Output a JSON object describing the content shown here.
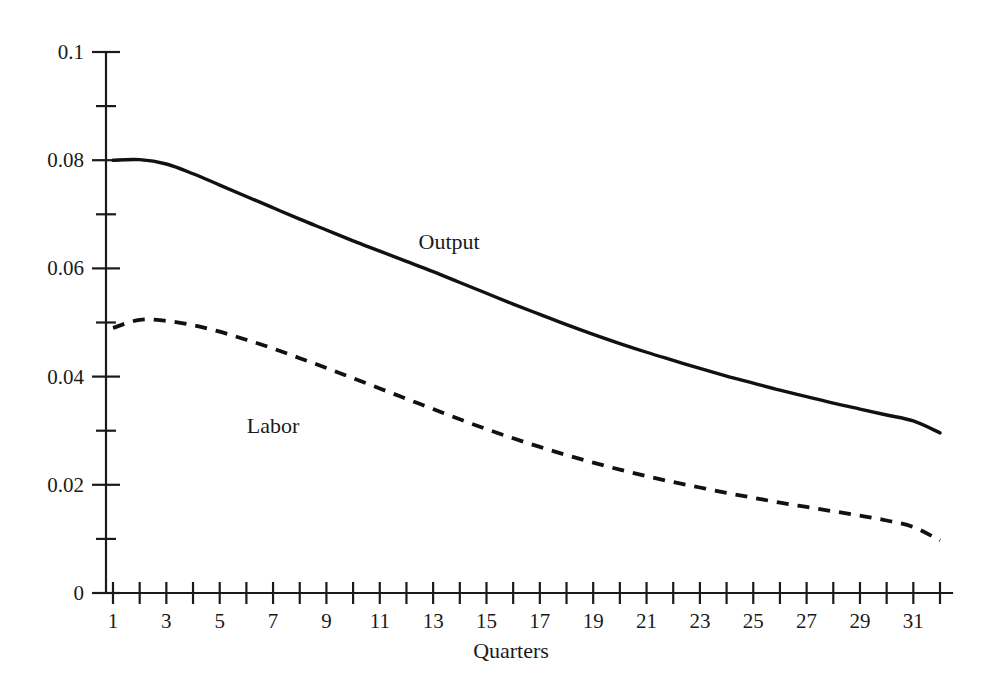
{
  "chart_data": {
    "type": "line",
    "title": "",
    "subtitle": "",
    "xlabel": "Quarters",
    "ylabel": "",
    "xlim": [
      1,
      32
    ],
    "ylim": [
      0,
      0.1
    ],
    "grid": false,
    "legend_position": "inline-annotation",
    "background_color": "#ffffff",
    "line_color": "#111111",
    "x": [
      1,
      2,
      3,
      4,
      5,
      6,
      7,
      8,
      9,
      10,
      11,
      12,
      13,
      14,
      15,
      16,
      17,
      18,
      19,
      20,
      21,
      22,
      23,
      24,
      25,
      26,
      27,
      28,
      29,
      30,
      31,
      32
    ],
    "x_tick_values": [
      1,
      2,
      3,
      4,
      5,
      6,
      7,
      8,
      9,
      10,
      11,
      12,
      13,
      14,
      15,
      16,
      17,
      18,
      19,
      20,
      21,
      22,
      23,
      24,
      25,
      26,
      27,
      28,
      29,
      30,
      31,
      32
    ],
    "x_tick_labels": [
      "1",
      "",
      "3",
      "",
      "5",
      "",
      "7",
      "",
      "9",
      "",
      "11",
      "",
      "13",
      "",
      "15",
      "",
      "17",
      "",
      "19",
      "",
      "21",
      "",
      "23",
      "",
      "25",
      "",
      "27",
      "",
      "29",
      "",
      "31",
      ""
    ],
    "y_tick_values": [
      0,
      0.01,
      0.02,
      0.03,
      0.04,
      0.05,
      0.06,
      0.07,
      0.08,
      0.09,
      0.1
    ],
    "y_tick_labels": [
      "0",
      "",
      "0.02",
      "",
      "0.04",
      "",
      "0.06",
      "",
      "0.08",
      "",
      "0.1"
    ],
    "series": [
      {
        "name": "Output",
        "style": "solid",
        "label_x": 13.6,
        "label_y": 0.0635,
        "values": [
          0.08,
          0.0801,
          0.0793,
          0.0775,
          0.0754,
          0.0733,
          0.0712,
          0.0691,
          0.0671,
          0.0651,
          0.0632,
          0.0613,
          0.0594,
          0.0574,
          0.0554,
          0.0534,
          0.0515,
          0.0496,
          0.0478,
          0.0461,
          0.0445,
          0.043,
          0.0415,
          0.0401,
          0.0388,
          0.0375,
          0.0363,
          0.0351,
          0.034,
          0.0329,
          0.0318,
          0.0296
        ]
      },
      {
        "name": "Labor",
        "style": "dashed",
        "label_x": 7.0,
        "label_y": 0.0295,
        "values": [
          0.049,
          0.0505,
          0.0503,
          0.0495,
          0.0483,
          0.0468,
          0.0452,
          0.0434,
          0.0416,
          0.0397,
          0.0378,
          0.0359,
          0.034,
          0.0321,
          0.0303,
          0.0286,
          0.027,
          0.0255,
          0.0241,
          0.0228,
          0.0216,
          0.0205,
          0.0195,
          0.0185,
          0.0176,
          0.0167,
          0.0159,
          0.0151,
          0.0143,
          0.0134,
          0.0122,
          0.0097
        ]
      }
    ]
  }
}
